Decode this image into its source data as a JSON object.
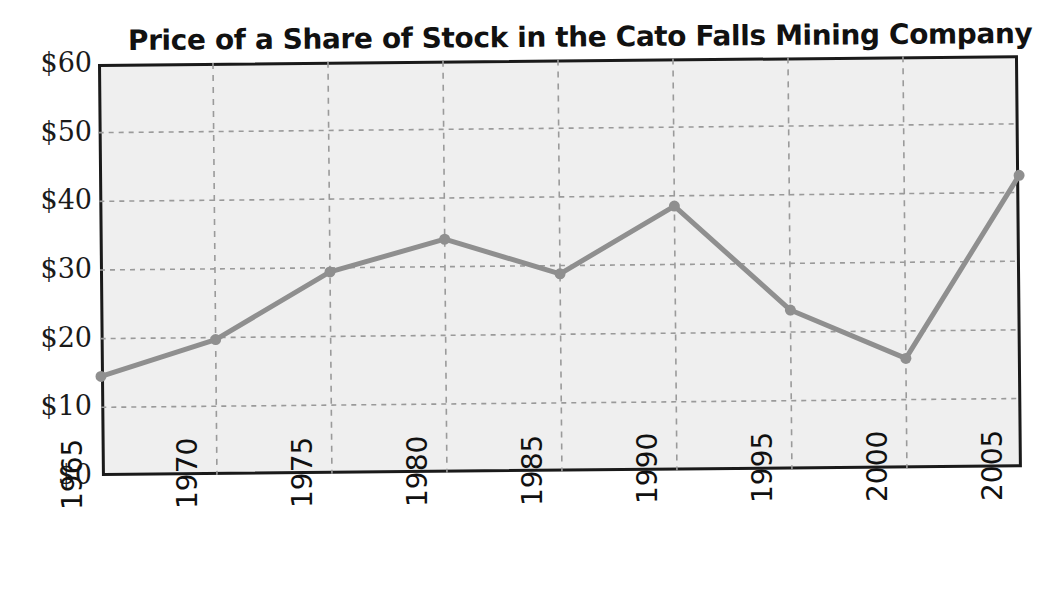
{
  "chart_data": {
    "type": "line",
    "title": "Price of a Share of Stock in the Cato Falls Mining Company",
    "xlabel": "",
    "ylabel": "",
    "x": [
      1965,
      1970,
      1975,
      1980,
      1985,
      1990,
      1995,
      2000,
      2005
    ],
    "categories": [
      "1965",
      "1970",
      "1975",
      "1980",
      "1985",
      "1990",
      "1995",
      "2000",
      "2005"
    ],
    "values": [
      14.5,
      19.7,
      29.4,
      34.0,
      28.8,
      38.5,
      23.2,
      16.0,
      42.5
    ],
    "series": [
      {
        "name": "Share price",
        "values": [
          14.5,
          19.7,
          29.4,
          34.0,
          28.8,
          38.5,
          23.2,
          16.0,
          42.5
        ]
      }
    ],
    "ylim": [
      0,
      60
    ],
    "yticks": [
      0,
      10,
      20,
      30,
      40,
      50,
      60
    ],
    "ytick_labels": [
      "$0",
      "$10",
      "$20",
      "$30",
      "$40",
      "$50",
      "$60"
    ],
    "xtick_labels": [
      "1965",
      "1970",
      "1975",
      "1980",
      "1985",
      "1990",
      "1995",
      "2000",
      "2005"
    ],
    "grid": "both-dashed",
    "legend": "none",
    "colors": {
      "line": "#8f8f8f",
      "marker": "#8f8f8f",
      "plot_background": "#efefef",
      "frame": "#1a1a1a",
      "gridline": "#9a9a9a",
      "text": "#111111"
    },
    "marker": "circle",
    "marker_size": 11,
    "line_width": 5
  }
}
